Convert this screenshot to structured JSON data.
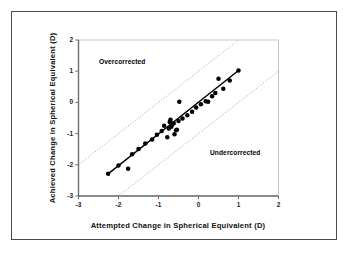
{
  "figure": {
    "frame_color": "#4a4a4a",
    "background": "#ffffff"
  },
  "chart_data": {
    "type": "scatter",
    "title": "",
    "subtitle": "",
    "xlabel": "Attempted Change in Spherical Equivalent (D)",
    "ylabel": "Achieved Change in Spherical Equivalent (D)",
    "xlim": [
      -3,
      2
    ],
    "ylim": [
      -3,
      2
    ],
    "xticks": [
      -3,
      -2,
      -1,
      0,
      1,
      2
    ],
    "yticks": [
      -3,
      -2,
      -1,
      0,
      1,
      2
    ],
    "xtick_labels": [
      "-3",
      "-2",
      "-1",
      "0",
      "1",
      "2"
    ],
    "ytick_labels": [
      "-3",
      "-2",
      "-1",
      "0",
      "1",
      "2"
    ],
    "grid": false,
    "legend": null,
    "marker": {
      "shape": "circle",
      "color": "#000000",
      "size_px": 3.4
    },
    "series": [
      {
        "name": "Eyes",
        "type": "scatter",
        "points": [
          [
            -2.26,
            -2.29
          ],
          [
            -2.0,
            -2.02
          ],
          [
            -1.76,
            -2.13
          ],
          [
            -1.66,
            -1.66
          ],
          [
            -1.5,
            -1.49
          ],
          [
            -1.33,
            -1.32
          ],
          [
            -1.16,
            -1.19
          ],
          [
            -1.04,
            -1.04
          ],
          [
            -0.92,
            -0.92
          ],
          [
            -0.86,
            -0.75
          ],
          [
            -0.78,
            -1.12
          ],
          [
            -0.74,
            -0.84
          ],
          [
            -0.72,
            -0.63
          ],
          [
            -0.7,
            -0.56
          ],
          [
            -0.68,
            -0.78
          ],
          [
            -0.66,
            -0.72
          ],
          [
            -0.62,
            -0.67
          ],
          [
            -0.6,
            -1.02
          ],
          [
            -0.56,
            -0.89
          ],
          [
            -0.54,
            -0.88
          ],
          [
            -0.5,
            -0.6
          ],
          [
            -0.48,
            0.02
          ],
          [
            -0.4,
            -0.52
          ],
          [
            -0.28,
            -0.41
          ],
          [
            -0.16,
            -0.3
          ],
          [
            -0.06,
            -0.16
          ],
          [
            0.06,
            -0.06
          ],
          [
            0.18,
            0.04
          ],
          [
            0.24,
            0.02
          ],
          [
            0.34,
            0.2
          ],
          [
            0.42,
            0.3
          ],
          [
            0.5,
            0.76
          ],
          [
            0.62,
            0.44
          ],
          [
            0.78,
            0.7
          ],
          [
            1.0,
            1.02
          ]
        ]
      }
    ],
    "fit_line": {
      "name": "regression-line",
      "style": "solid",
      "color": "#000000",
      "width_px": 1.4,
      "x_start": -2.26,
      "y_start": -2.29,
      "x_end": 1.0,
      "y_end": 1.02
    },
    "reference_lines": [
      {
        "name": "overcorrection-boundary",
        "style": "dotted",
        "color": "#9a9a9a",
        "slope": 1,
        "intercept": 1.0,
        "position": "upper"
      },
      {
        "name": "undercorrection-boundary",
        "style": "dotted",
        "color": "#9a9a9a",
        "slope": 1,
        "intercept": -1.0,
        "position": "lower"
      }
    ],
    "annotations": [
      {
        "name": "overcorrected",
        "text": "Overcorrected",
        "x": -2.3,
        "y": 1.32
      },
      {
        "name": "undercorrected",
        "text": "Undercorrected",
        "x": 0.05,
        "y": -1.55
      }
    ]
  }
}
